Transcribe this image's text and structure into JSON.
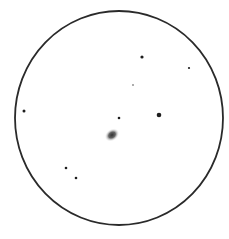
{
  "sketch": {
    "background": "#ffffff",
    "field": {
      "cx": 119,
      "cy": 118,
      "rx": 104,
      "ry": 107,
      "stroke": "#2a2a2a"
    },
    "galaxy": {
      "cx": 112,
      "cy": 135,
      "rx": 6,
      "ry": 4,
      "rotate": -35,
      "color": "#4a4a4a"
    },
    "stars": [
      {
        "x": 142,
        "y": 57,
        "r": 1.6
      },
      {
        "x": 189,
        "y": 68,
        "r": 1.1
      },
      {
        "x": 133,
        "y": 85,
        "r": 0.7
      },
      {
        "x": 159,
        "y": 115,
        "r": 2.3
      },
      {
        "x": 119,
        "y": 118,
        "r": 1.3
      },
      {
        "x": 24,
        "y": 111,
        "r": 1.5
      },
      {
        "x": 66,
        "y": 168,
        "r": 1.3
      },
      {
        "x": 76,
        "y": 178,
        "r": 1.3
      }
    ]
  }
}
